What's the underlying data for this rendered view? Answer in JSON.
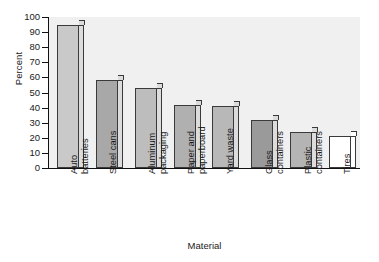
{
  "chart_data": {
    "type": "bar",
    "title": "",
    "xlabel": "Material",
    "ylabel": "Percent",
    "ylim": [
      0,
      100
    ],
    "yticks": [
      0,
      10,
      20,
      30,
      40,
      50,
      60,
      70,
      80,
      90,
      100
    ],
    "grid": false,
    "legend": null,
    "categories": [
      "Auto batteries",
      "Steel cans",
      "Aluminum packaging",
      "Paper and paperboard",
      "Yard waste",
      "Glass containers",
      "Plastic containers",
      "Tires"
    ],
    "category_lines": [
      [
        "Auto",
        "batteries"
      ],
      [
        "Steel cans",
        ""
      ],
      [
        "Aluminum",
        "packaging"
      ],
      [
        "Paper and",
        "paperboard"
      ],
      [
        "Yard waste",
        ""
      ],
      [
        "Glass",
        "containers"
      ],
      [
        "Plastic",
        "containers"
      ],
      [
        "Tires",
        ""
      ]
    ],
    "values": [
      95,
      58,
      53,
      42,
      41,
      32,
      24,
      21
    ],
    "bar_colors": [
      "#c9c9c9",
      "#a8a8a8",
      "#bdbdbd",
      "#b0b0b0",
      "#b8b8b8",
      "#9a9a9a",
      "#b4b4b4",
      "#ffffff"
    ],
    "plot_background": "#f0f0f0",
    "axis_color": "#111111",
    "bar_edge_color": "#3a3a3a"
  },
  "axis": {
    "y_label": "Percent",
    "x_label": "Material",
    "tick_100": "100",
    "tick_90": "90",
    "tick_80": "80",
    "tick_70": "70",
    "tick_60": "60",
    "tick_50": "50",
    "tick_40": "40",
    "tick_30": "30",
    "tick_20": "20",
    "tick_10": "10",
    "tick_0": "0"
  }
}
